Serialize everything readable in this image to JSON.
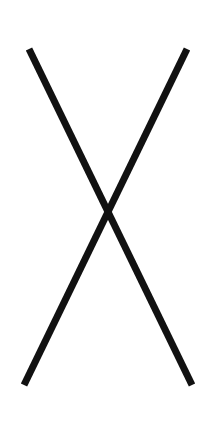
{
  "figure": {
    "background": "#ffffff",
    "stroke_color": "#111111",
    "stroke_width": 7,
    "lines": [
      {
        "name": "descending-stroke",
        "x1": 29,
        "y1": 49,
        "x2": 192,
        "y2": 385
      },
      {
        "name": "ascending-stroke",
        "x1": 187,
        "y1": 49,
        "x2": 24,
        "y2": 385
      }
    ]
  }
}
